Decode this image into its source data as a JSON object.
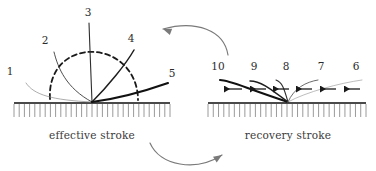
{
  "figure": {
    "type": "diagram",
    "background_color": "#ffffff",
    "width": 376,
    "height": 171
  },
  "panels": [
    {
      "id": "effective-stroke",
      "caption": "effective stroke",
      "caption_x": 92,
      "caption_y": 139,
      "baseline": {
        "x1": 14,
        "x2": 170,
        "y": 103,
        "hatch_count": 30,
        "hatch_length": 14
      },
      "anchor": {
        "x": 92,
        "y": 102
      },
      "positions": [
        {
          "label": "1",
          "label_x": 10,
          "label_y": 75,
          "stroke": "#8a8a8a",
          "width": 0.7,
          "dashed": false,
          "path": "M 26 83 C 34 95 52 100 92 102"
        },
        {
          "label": "2",
          "label_x": 45,
          "label_y": 44,
          "stroke": "#3a3a3a",
          "width": 0.9,
          "dashed": false,
          "path": "M 54 52 C 58 68 66 88 92 102"
        },
        {
          "label": "3",
          "label_x": 88,
          "label_y": 16,
          "stroke": "#2e2e2e",
          "width": 1.1,
          "dashed": false,
          "path": "M 89 23 C 90 50 91 80 92 102"
        },
        {
          "label": "4",
          "label_x": 131,
          "label_y": 42,
          "stroke": "#1e1e1e",
          "width": 1.5,
          "dashed": false,
          "path": "M 134 50 C 126 64 108 86 92 102"
        },
        {
          "label": "5",
          "label_x": 172,
          "label_y": 77,
          "stroke": "#111111",
          "width": 2.1,
          "dashed": false,
          "path": "M 168 83 C 148 90 116 99 92 102"
        }
      ],
      "envelope": {
        "stroke": "#1a1a1a",
        "width": 1.8,
        "dash": "5,3.5",
        "path": "M 50 99 C 48 66 72 50 95 52 C 120 54 138 74 138 100"
      }
    },
    {
      "id": "recovery-stroke",
      "caption": "recovery stroke",
      "caption_x": 288,
      "caption_y": 139,
      "baseline": {
        "x1": 208,
        "x2": 366,
        "y": 103,
        "hatch_count": 30,
        "hatch_length": 14
      },
      "anchor": {
        "x": 288,
        "y": 102
      },
      "positions": [
        {
          "label": "10",
          "label_x": 218,
          "label_y": 70,
          "stroke": "#111111",
          "width": 2.1,
          "dashed": false,
          "path": "M 220 80 C 229 80 240 86 288 102"
        },
        {
          "label": "9",
          "label_x": 254,
          "label_y": 70,
          "stroke": "#1e1e1e",
          "width": 1.5,
          "dashed": false,
          "path": "M 250 81 C 260 81 268 87 288 102"
        },
        {
          "label": "8",
          "label_x": 286,
          "label_y": 70,
          "stroke": "#2e2e2e",
          "width": 1.1,
          "dashed": false,
          "path": "M 276 80 C 282 82 284 88 288 102"
        },
        {
          "label": "7",
          "label_x": 321,
          "label_y": 70,
          "stroke": "#5a5a5a",
          "width": 0.9,
          "dashed": false,
          "path": "M 318 80 C 306 82 294 88 288 102"
        },
        {
          "label": "6",
          "label_x": 356,
          "label_y": 70,
          "stroke": "#a0a0a0",
          "width": 0.7,
          "dashed": false,
          "path": "M 362 80 C 340 83 306 92 288 102"
        }
      ],
      "motion_arrows": {
        "direction": "leftward",
        "color": "#1a1a1a",
        "y": 89,
        "items": [
          {
            "x_tail": 242,
            "x_head": 224
          },
          {
            "x_tail": 266,
            "x_head": 250
          },
          {
            "x_tail": 289,
            "x_head": 273
          },
          {
            "x_tail": 312,
            "x_head": 296
          },
          {
            "x_tail": 336,
            "x_head": 320
          },
          {
            "x_tail": 360,
            "x_head": 344
          }
        ]
      }
    }
  ],
  "cycle_arrows": [
    {
      "id": "top-cycle-arrow",
      "direction": "right-to-left",
      "color": "#7a7a7a",
      "path": "M 228 55 C 224 30 196 20 163 29",
      "head": {
        "x": 163,
        "y": 29,
        "angle": 200
      }
    },
    {
      "id": "bottom-cycle-arrow",
      "direction": "left-to-right",
      "color": "#7a7a7a",
      "path": "M 150 143 C 160 166 196 172 222 155",
      "head": {
        "x": 222,
        "y": 155,
        "angle": -33
      }
    }
  ],
  "colors": {
    "background": "#ffffff",
    "baseline": "#4a4a4a",
    "hatch": "#9a9a9a",
    "text": "#3a3a3a",
    "arrow": "#7a7a7a"
  }
}
